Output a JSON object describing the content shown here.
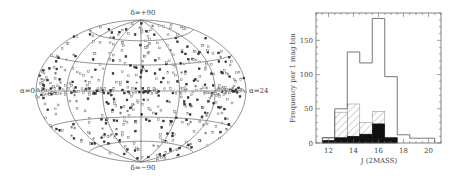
{
  "chart_data": [
    {
      "type": "scatter",
      "projection": "aitoff",
      "title": "",
      "labels": {
        "top": "δ=+90",
        "bottom": "δ=−90",
        "left": "α=0",
        "right": "α=24"
      },
      "grid": {
        "parallels_deg": [
          -60,
          -30,
          0,
          30,
          60
        ],
        "meridians_hours": [
          0,
          6,
          12,
          18,
          24
        ]
      },
      "n_points_approx": 600,
      "description": "All-sky distribution of sources, filled and open markers"
    },
    {
      "type": "bar",
      "histogram": true,
      "xlabel": "J (2MASS)",
      "ylabel": "Frequency per 1 mag bin",
      "xlim": [
        11,
        21
      ],
      "ylim": [
        0,
        190
      ],
      "xticks": [
        "12",
        "14",
        "16",
        "18",
        "20"
      ],
      "yticks": [
        "0",
        "50",
        "100",
        "150"
      ],
      "bin_edges": [
        11.5,
        12.5,
        13.5,
        14.5,
        15.5,
        16.5,
        17.5,
        18.5,
        19.5,
        20.5
      ],
      "series": [
        {
          "name": "all (open)",
          "style": "open",
          "values": [
            8,
            50,
            133,
            117,
            182,
            97,
            12,
            7,
            7
          ]
        },
        {
          "name": "subset (hatched)",
          "style": "hatched",
          "values": [
            7,
            45,
            57,
            30,
            46,
            7,
            0,
            0,
            0
          ]
        },
        {
          "name": "subset (filled)",
          "style": "filled",
          "values": [
            4,
            8,
            10,
            13,
            28,
            8,
            0,
            0,
            0
          ]
        }
      ],
      "grid": false,
      "legend": "none"
    }
  ]
}
